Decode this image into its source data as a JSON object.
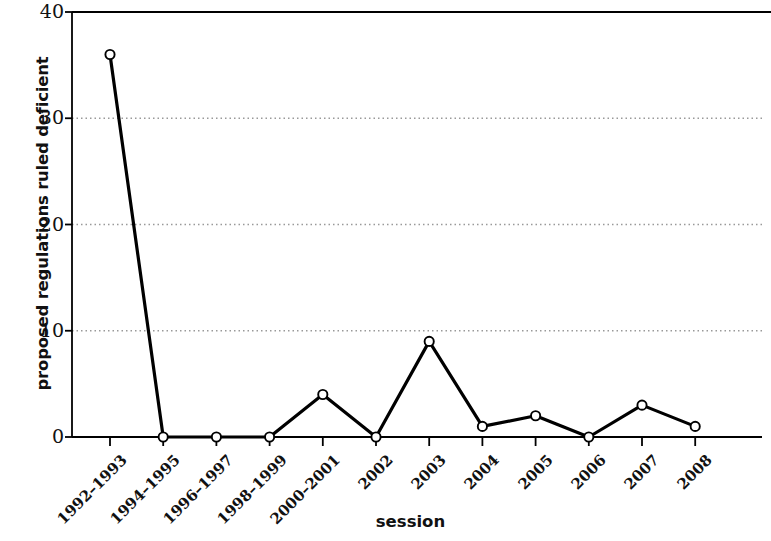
{
  "chart_data": {
    "type": "line",
    "title": "",
    "xlabel": "session",
    "ylabel": "proposed regulations ruled deficient",
    "categories": [
      "1992–1993",
      "1994–1995",
      "1996–1997",
      "1998–1999",
      "2000–2001",
      "2002",
      "2003",
      "2004",
      "2005",
      "2006",
      "2007",
      "2008"
    ],
    "values": [
      36,
      0,
      0,
      0,
      4,
      0,
      9,
      1,
      2,
      0,
      3,
      1
    ],
    "series": [
      {
        "name": "proposed regulations ruled deficient",
        "values": [
          36,
          0,
          0,
          0,
          4,
          0,
          9,
          1,
          2,
          0,
          3,
          1
        ]
      }
    ],
    "ylim": [
      0,
      40
    ],
    "yticks": [
      0,
      10,
      20,
      30,
      40
    ],
    "ytick_labels": [
      "0",
      "10",
      "20",
      "30",
      "40"
    ],
    "grid": "horizontal-dotted",
    "legend": "none",
    "marker": "open-circle",
    "line_color": "#000000",
    "marker_fill": "#ffffff",
    "marker_stroke": "#000000",
    "grid_color": "#999999",
    "axis_color": "#000000"
  },
  "axes": {
    "y_title": "proposed regulations ruled deficient",
    "x_title": "session"
  }
}
